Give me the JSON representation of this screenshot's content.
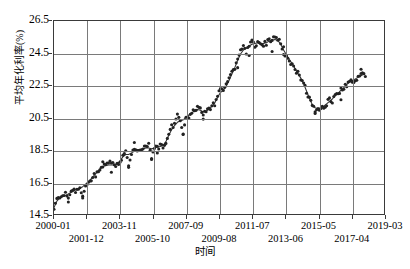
{
  "chart_data": {
    "type": "scatter",
    "title": "",
    "xlabel": "时间",
    "ylabel": "平均年化利率(%)",
    "ylim": [
      14.5,
      26.5
    ],
    "yticks": [
      14.5,
      16.5,
      18.5,
      20.5,
      22.5,
      24.5,
      26.5
    ],
    "xticks": [
      "2000-01",
      "2001-12",
      "2003-11",
      "2005-10",
      "2007-09",
      "2009-08",
      "2011-07",
      "2013-06",
      "2015-05",
      "2017-04",
      "2019-03"
    ],
    "xtick_rows": [
      0,
      1,
      0,
      1,
      0,
      1,
      0,
      1,
      0,
      1,
      0
    ],
    "grid": true,
    "legend": null,
    "marker_color": "#222222",
    "line_color": "#333333",
    "series": [
      {
        "name": "平均年化利率(%)",
        "kind": "scatter",
        "x": [
          "2000-01",
          "2000-03",
          "2000-05",
          "2000-07",
          "2000-09",
          "2000-11",
          "2001-01",
          "2001-03",
          "2001-05",
          "2001-07",
          "2001-09",
          "2001-11",
          "2002-01",
          "2002-03",
          "2002-05",
          "2002-07",
          "2002-09",
          "2002-11",
          "2003-01",
          "2003-03",
          "2003-05",
          "2003-07",
          "2003-09",
          "2003-11",
          "2004-01",
          "2004-03",
          "2004-05",
          "2004-07",
          "2004-09",
          "2004-11",
          "2005-01",
          "2005-03",
          "2005-05",
          "2005-07",
          "2005-09",
          "2005-11",
          "2006-01",
          "2006-03",
          "2006-05",
          "2006-07",
          "2006-09",
          "2006-11",
          "2007-01",
          "2007-03",
          "2007-05",
          "2007-07",
          "2007-09",
          "2007-11",
          "2008-01",
          "2008-03",
          "2008-05",
          "2008-07",
          "2008-09",
          "2008-11",
          "2009-01",
          "2009-03",
          "2009-05",
          "2009-07",
          "2009-09",
          "2009-11",
          "2010-01",
          "2010-03",
          "2010-05",
          "2010-07",
          "2010-09",
          "2010-11",
          "2011-01",
          "2011-03",
          "2011-05",
          "2011-07",
          "2011-09",
          "2011-11",
          "2012-01",
          "2012-03",
          "2012-05",
          "2012-07",
          "2012-09",
          "2012-11",
          "2013-01",
          "2013-03",
          "2013-05",
          "2013-07",
          "2013-09",
          "2013-11",
          "2014-01",
          "2014-03",
          "2014-05",
          "2014-07",
          "2014-09",
          "2014-11",
          "2015-01",
          "2015-03",
          "2015-05",
          "2015-07",
          "2015-09",
          "2015-11",
          "2016-01",
          "2016-03",
          "2016-05",
          "2016-07",
          "2016-09",
          "2016-11",
          "2017-01",
          "2017-03",
          "2017-05",
          "2017-07",
          "2017-09",
          "2017-11",
          "2018-01"
        ],
        "y": [
          14.75,
          15.45,
          15.55,
          15.6,
          15.7,
          15.35,
          15.8,
          15.9,
          16.0,
          16.1,
          15.55,
          16.3,
          16.45,
          16.6,
          16.9,
          17.0,
          17.3,
          17.55,
          17.45,
          17.75,
          17.6,
          17.5,
          17.55,
          17.85,
          18.0,
          18.35,
          17.5,
          18.3,
          18.45,
          18.55,
          18.35,
          18.6,
          18.6,
          18.75,
          18.0,
          18.55,
          18.65,
          18.75,
          18.6,
          19.0,
          19.55,
          19.9,
          20.0,
          20.55,
          20.4,
          19.5,
          20.45,
          20.6,
          20.8,
          20.9,
          21.1,
          21.0,
          20.55,
          20.9,
          21.0,
          21.3,
          21.35,
          21.75,
          22.3,
          22.1,
          22.5,
          22.9,
          23.35,
          23.55,
          24.1,
          24.6,
          24.85,
          24.6,
          25.0,
          25.2,
          25.0,
          25.25,
          25.1,
          25.0,
          25.15,
          25.35,
          25.2,
          25.55,
          25.3,
          25.2,
          24.45,
          24.3,
          24.05,
          23.85,
          23.5,
          23.3,
          22.9,
          22.75,
          22.1,
          21.7,
          21.35,
          21.0,
          20.95,
          21.15,
          21.2,
          21.35,
          21.6,
          21.45,
          21.9,
          22.0,
          22.2,
          22.35,
          22.5,
          22.9,
          22.55,
          22.75,
          22.95,
          23.2,
          23.15
        ],
        "trend_name": "平滑趋势线",
        "trend_y": [
          14.9,
          15.3,
          15.5,
          15.6,
          15.65,
          15.75,
          15.85,
          15.95,
          16.05,
          16.1,
          16.2,
          16.35,
          16.5,
          16.7,
          16.9,
          17.1,
          17.3,
          17.45,
          17.5,
          17.55,
          17.55,
          17.55,
          17.6,
          17.8,
          18.05,
          18.2,
          18.2,
          18.3,
          18.4,
          18.5,
          18.5,
          18.55,
          18.6,
          18.6,
          18.55,
          18.6,
          18.65,
          18.7,
          18.75,
          19.0,
          19.4,
          19.75,
          20.0,
          20.2,
          20.3,
          20.35,
          20.5,
          20.65,
          20.8,
          20.9,
          21.0,
          20.95,
          20.85,
          20.9,
          21.0,
          21.2,
          21.4,
          21.75,
          22.05,
          22.2,
          22.45,
          22.8,
          23.2,
          23.6,
          24.05,
          24.45,
          24.7,
          24.8,
          24.95,
          25.05,
          25.1,
          25.15,
          25.1,
          25.1,
          25.15,
          25.25,
          25.3,
          25.35,
          25.3,
          25.05,
          24.7,
          24.4,
          24.1,
          23.85,
          23.55,
          23.25,
          22.95,
          22.6,
          22.15,
          21.7,
          21.3,
          21.1,
          21.05,
          21.1,
          21.2,
          21.35,
          21.5,
          21.65,
          21.85,
          22.0,
          22.2,
          22.35,
          22.55,
          22.7,
          22.8,
          22.9,
          23.0,
          23.1,
          23.2
        ]
      }
    ]
  },
  "axis": {
    "y_label": "平均年化利率(%)",
    "x_label": "时间"
  }
}
